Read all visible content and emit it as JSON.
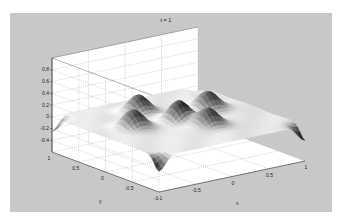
{
  "window": {
    "background": "#ffffff",
    "figure_background": "#c8c8c8",
    "axes_face": "#ffffff"
  },
  "chart_data": {
    "type": "surface",
    "title": "t = 1",
    "xlabel": "x",
    "ylabel": "y",
    "zlabel": "",
    "xlim": [
      -1,
      1
    ],
    "ylim": [
      -1,
      1
    ],
    "zlim": [
      -0.6,
      1
    ],
    "xticks": [
      -1,
      -0.5,
      0,
      0.5,
      1
    ],
    "xtick_labels": [
      "-1",
      "-0.5",
      "0",
      "0.5",
      "1"
    ],
    "yticks": [
      -1,
      -0.5,
      0,
      0.5,
      1
    ],
    "ytick_labels": [
      "-1",
      "-0.5",
      "0",
      "0.5",
      "1"
    ],
    "zticks": [
      -0.4,
      -0.2,
      0,
      0.2,
      0.4,
      0.6,
      0.8
    ],
    "ztick_labels": [
      "-0.4",
      "-0.2",
      "0",
      "0.2",
      "0.4",
      "0.6",
      "0.8"
    ],
    "grid": true,
    "grid_style": "dotted",
    "colormap": "gray",
    "view": "3d-perspective",
    "surface_base_level": 0,
    "features": [
      {
        "label": "bump",
        "x": 0.0,
        "y": 0.0,
        "height": 0.35
      },
      {
        "label": "bump",
        "x": -0.15,
        "y": 0.55,
        "height": 0.3
      },
      {
        "label": "bump",
        "x": -0.55,
        "y": 0.1,
        "height": 0.3
      },
      {
        "label": "bump",
        "x": 0.55,
        "y": 0.2,
        "height": 0.3
      },
      {
        "label": "bump",
        "x": 0.15,
        "y": -0.35,
        "height": 0.32
      },
      {
        "label": "dip",
        "x": -1,
        "y": 1,
        "depth": -0.25
      },
      {
        "label": "dip",
        "x": -1,
        "y": -1,
        "depth": -0.25
      },
      {
        "label": "dip",
        "x": 1,
        "y": -1,
        "depth": -0.25
      },
      {
        "label": "dip",
        "x": 1,
        "y": 1,
        "depth": -0.25
      }
    ]
  },
  "projection": {
    "origin_x": 168.5,
    "x_per_x": 73,
    "x_per_y": -53.5,
    "origin_y": 143.5,
    "y_per_x": -15.5,
    "y_per_y": -20,
    "z_px_per_unit": 58.75
  }
}
